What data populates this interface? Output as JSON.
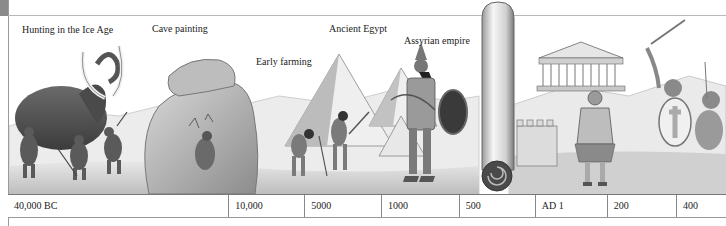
{
  "captions": [
    {
      "id": "ice-age",
      "label": "Hunting in the Ice Age",
      "x": 22,
      "y": 24
    },
    {
      "id": "cave-painting",
      "label": "Cave painting",
      "x": 152,
      "y": 23
    },
    {
      "id": "early-farming",
      "label": "Early farming",
      "x": 256,
      "y": 56
    },
    {
      "id": "ancient-egypt",
      "label": "Ancient Egypt",
      "x": 329,
      "y": 23
    },
    {
      "id": "assyrian-empire",
      "label": "Assyrian empire",
      "x": 404,
      "y": 35
    }
  ],
  "timeline": {
    "cells": [
      {
        "label": "40,000 BC",
        "width": 230
      },
      {
        "label": "10,000",
        "width": 79
      },
      {
        "label": "5000",
        "width": 80
      },
      {
        "label": "1000",
        "width": 81
      },
      {
        "label": "500",
        "width": 79
      },
      {
        "label": "AD 1",
        "width": 75
      },
      {
        "label": "200",
        "width": 72
      },
      {
        "label": "400",
        "width": 52
      }
    ]
  },
  "colors": {
    "ink": "#222222",
    "rule": "#888888",
    "sketch_dark": "#555555",
    "sketch_mid": "#9a9a9a",
    "sketch_light": "#d4d4d4"
  }
}
